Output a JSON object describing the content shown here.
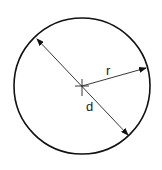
{
  "diagram": {
    "labels": {
      "radius": "r",
      "diameter": "d"
    },
    "colors": {
      "stroke": "#111111",
      "background": "#ffffff"
    }
  }
}
